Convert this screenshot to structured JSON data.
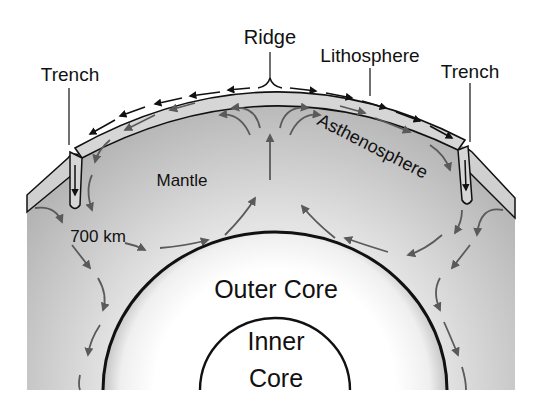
{
  "labels": {
    "ridge": "Ridge",
    "lithosphere": "Lithosphere",
    "trench_left": "Trench",
    "trench_right": "Trench",
    "asthenosphere": "Asthenosphere",
    "mantle": "Mantle",
    "depth_700": "700 km",
    "outer_core": "Outer Core",
    "inner_core_line1": "Inner",
    "inner_core_line2": "Core"
  },
  "colors": {
    "background": "#ffffff",
    "mantle_dark": "#a8a8a8",
    "mantle_light": "#d6d6d6",
    "asthenosphere": "#bdbdbd",
    "lithosphere": "#d4d4d4",
    "outer_core_edge": "#c8c8c8",
    "core_fill": "#ffffff",
    "outline": "#111111",
    "plate_arrow": "#111111",
    "convection_arrow": "#5a5a5a"
  }
}
